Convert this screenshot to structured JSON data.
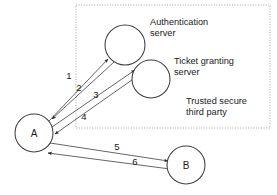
{
  "diagram": {
    "background_color": "#ffffff",
    "stroke_color": "#4a4a4a",
    "node_stroke_color": "#3d3d3d",
    "box_stroke_color": "#9a9a9a",
    "group_box": {
      "label": "trusted-third-party-boundary",
      "style": "dotted",
      "x": 76,
      "y": 5,
      "width": 194,
      "height": 123
    },
    "nodes": [
      {
        "id": "auth",
        "label": "",
        "cx": 125,
        "cy": 45,
        "r": 20
      },
      {
        "id": "tgs",
        "label": "",
        "cx": 151,
        "cy": 79,
        "r": 19
      },
      {
        "id": "A",
        "label": "A",
        "cx": 34,
        "cy": 133,
        "r": 19
      },
      {
        "id": "B",
        "label": "B",
        "cx": 186,
        "cy": 165,
        "r": 19
      }
    ],
    "captions": [
      {
        "id": "auth-caption",
        "lines": [
          "Authentication",
          "server"
        ],
        "x": 150,
        "y": 25
      },
      {
        "id": "tgs-caption",
        "lines": [
          "Ticket granting",
          "server"
        ],
        "x": 174,
        "y": 64
      },
      {
        "id": "ttp-caption",
        "lines": [
          "Trusted secure",
          "third party"
        ],
        "x": 186,
        "y": 104
      }
    ],
    "edges": [
      {
        "id": "edge-1",
        "label": "1",
        "from": "A",
        "to": "auth",
        "x1": 48,
        "y1": 122,
        "x2": 108,
        "y2": 59,
        "label_x": 69,
        "label_y": 79,
        "direction": "to"
      },
      {
        "id": "edge-2",
        "label": "2",
        "from": "auth",
        "to": "A",
        "x1": 114,
        "y1": 62,
        "x2": 52,
        "y2": 119,
        "label_x": 79,
        "label_y": 91,
        "direction": "to"
      },
      {
        "id": "edge-3",
        "label": "3",
        "from": "A",
        "to": "tgs",
        "x1": 52,
        "y1": 127,
        "x2": 135,
        "y2": 70,
        "label_x": 96,
        "label_y": 98,
        "direction": "to"
      },
      {
        "id": "edge-4",
        "label": "4",
        "from": "tgs",
        "to": "A",
        "x1": 139,
        "y1": 75,
        "x2": 55,
        "y2": 134,
        "label_x": 84,
        "label_y": 120,
        "direction": "to"
      },
      {
        "id": "edge-5",
        "label": "5",
        "from": "A",
        "to": "B",
        "x1": 50,
        "y1": 143,
        "x2": 168,
        "y2": 161,
        "label_x": 117,
        "label_y": 150,
        "direction": "to"
      },
      {
        "id": "edge-6",
        "label": "6",
        "from": "B",
        "to": "A",
        "x1": 170,
        "y1": 169,
        "x2": 48,
        "y2": 153,
        "label_x": 135,
        "label_y": 165,
        "direction": "to"
      }
    ]
  }
}
